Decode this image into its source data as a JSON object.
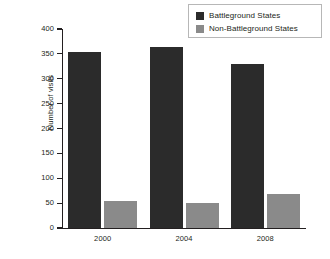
{
  "chart_data": {
    "type": "bar",
    "title": "",
    "subtitle": "",
    "xlabel": "",
    "ylabel": "Number of visits",
    "categories": [
      "2000",
      "2004",
      "2008"
    ],
    "series": [
      {
        "name": "Battleground States",
        "color": "#2b2b2b",
        "values": [
          353,
          363,
          330
        ]
      },
      {
        "name": "Non-Battleground States",
        "color": "#8a8a8a",
        "values": [
          55,
          50,
          69
        ]
      }
    ],
    "ylim": [
      0,
      400
    ],
    "y_ticks": [
      0,
      50,
      100,
      150,
      200,
      250,
      300,
      350,
      400
    ],
    "y_tick_labels": [
      "0",
      "50",
      "100",
      "150",
      "200",
      "250",
      "300",
      "350",
      "400"
    ],
    "grid": false,
    "legend_position": "top-right"
  },
  "legend": {
    "entries": [
      {
        "label": "Battleground States"
      },
      {
        "label": "Non-Battleground States"
      }
    ]
  },
  "colors": {
    "battleground": "#2b2b2b",
    "non_battleground": "#8a8a8a",
    "axis": "#231f20",
    "legend_border": "#b7b7b7",
    "background": "#ffffff"
  }
}
